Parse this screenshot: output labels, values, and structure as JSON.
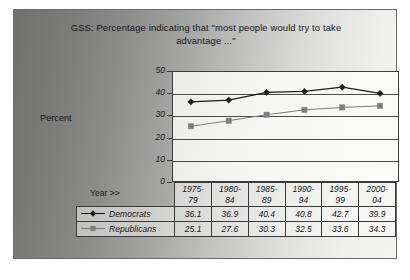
{
  "chart_data": {
    "type": "line",
    "title": "GSS:  Percentage indicating that \"most people would try to take advantage ...\"",
    "xlabel": "Year >>",
    "ylabel": "Percent",
    "categories": [
      "1975-\n79",
      "1980-\n84",
      "1985-\n89",
      "1990-\n94",
      "1995-\n99",
      "2000-\n04"
    ],
    "category_labels": [
      {
        "line1": "1975-",
        "line2": "79"
      },
      {
        "line1": "1980-",
        "line2": "84"
      },
      {
        "line1": "1985-",
        "line2": "89"
      },
      {
        "line1": "1990-",
        "line2": "94"
      },
      {
        "line1": "1995-",
        "line2": "99"
      },
      {
        "line1": "2000-",
        "line2": "04"
      }
    ],
    "series": [
      {
        "name": "Democrats",
        "marker": "diamond",
        "color": "#1c1c1c",
        "values": [
          36.1,
          36.9,
          40.4,
          40.8,
          42.7,
          39.9
        ]
      },
      {
        "name": "Republicans",
        "marker": "square",
        "color": "#7d7d7d",
        "values": [
          25.1,
          27.6,
          30.3,
          32.5,
          33.6,
          34.3
        ]
      }
    ],
    "ylim": [
      0,
      50
    ],
    "yticks": [
      50,
      40,
      30,
      20,
      10,
      0
    ],
    "grid": true,
    "legend_position": "bottom-table"
  },
  "colors": {
    "democrat_series": "#1c1c1c",
    "republican_series": "#7d7d7d",
    "plot_border": "#3c3c3c",
    "gridline": "#4a4a4a",
    "plate_dark": "#70706e",
    "plate_light": "#f3f3f1"
  }
}
